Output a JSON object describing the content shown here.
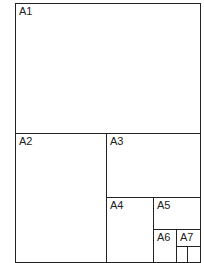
{
  "diagram": {
    "title": "",
    "line_color": "#222222",
    "background": "#ffffff",
    "sheets": [
      {
        "label": "A1"
      },
      {
        "label": "A2"
      },
      {
        "label": "A3"
      },
      {
        "label": "A4"
      },
      {
        "label": "A5"
      },
      {
        "label": "A6"
      },
      {
        "label": "A7"
      }
    ]
  }
}
